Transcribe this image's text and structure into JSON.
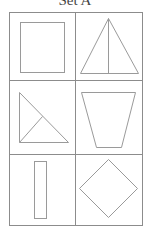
{
  "title": "Set A",
  "colors": {
    "background": "#ffffff",
    "grid_line": "#8c8c8c",
    "shape_line": "#9a9a9a",
    "title_text": "#444444"
  },
  "grid": {
    "rows": 3,
    "columns": 2,
    "left": 9,
    "top": 12,
    "right": 142,
    "bottom": 225,
    "column_divider_x": 75,
    "row_divider_y": [
      80,
      154
    ]
  },
  "cells": [
    {
      "row": 1,
      "col": 1,
      "shape": "square",
      "description": "Square outline"
    },
    {
      "row": 1,
      "col": 2,
      "shape": "isosceles-triangle-with-altitude",
      "description": "Isosceles triangle with vertical altitude line from apex to base"
    },
    {
      "row": 2,
      "col": 1,
      "shape": "right-triangle-with-segment",
      "description": "Right triangle with line from right-angle corner to hypotenuse"
    },
    {
      "row": 2,
      "col": 2,
      "shape": "trapezoid",
      "description": "Inverted trapezoid, wide top narrow bottom"
    },
    {
      "row": 3,
      "col": 1,
      "shape": "rectangle",
      "description": "Tall narrow rectangle"
    },
    {
      "row": 3,
      "col": 2,
      "shape": "diamond",
      "description": "Square rotated 45 degrees (rhombus)"
    }
  ]
}
